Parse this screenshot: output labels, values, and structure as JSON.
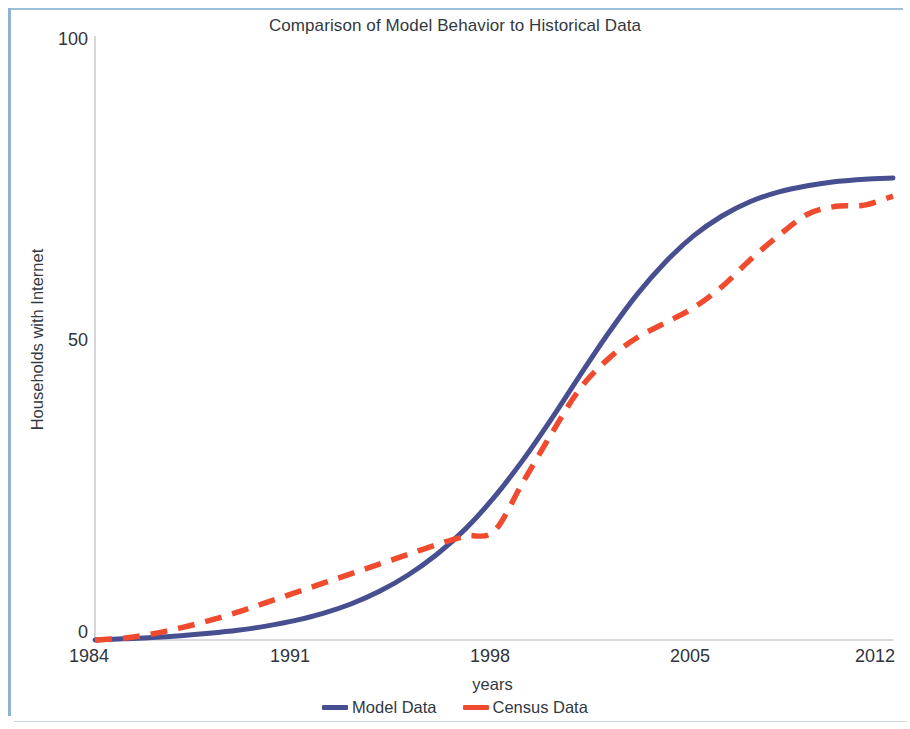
{
  "chart_data": {
    "type": "line",
    "title": "Comparison of Model Behavior to Historical Data",
    "xlabel": "years",
    "ylabel": "Households with Internet",
    "xlim": [
      1984,
      2012
    ],
    "ylim": [
      0,
      100
    ],
    "xticks": [
      1984,
      1991,
      1998,
      2005,
      2012
    ],
    "yticks": [
      0,
      50,
      100
    ],
    "grid": false,
    "legend_position": "bottom-center",
    "series": [
      {
        "name": "Model Data",
        "color": "#474f91",
        "style": "solid",
        "x": [
          1984,
          1985,
          1986,
          1987,
          1988,
          1989,
          1990,
          1991,
          1992,
          1993,
          1994,
          1995,
          1996,
          1997,
          1998,
          1999,
          2000,
          2001,
          2002,
          2003,
          2004,
          2005,
          2006,
          2007,
          2008,
          2009,
          2010,
          2011,
          2012
        ],
        "values": [
          0,
          0.2,
          0.4,
          0.7,
          1.1,
          1.6,
          2.3,
          3.2,
          4.4,
          6.0,
          8.1,
          10.8,
          14.2,
          18.4,
          23.6,
          29.7,
          36.5,
          43.7,
          50.7,
          57.1,
          62.5,
          66.9,
          70.2,
          72.6,
          74.2,
          75.2,
          75.9,
          76.3,
          76.5
        ]
      },
      {
        "name": "Census Data",
        "color": "#f04b2e",
        "style": "dashed",
        "x": [
          1984,
          1985,
          1986,
          1987,
          1988,
          1989,
          1990,
          1991,
          1992,
          1993,
          1994,
          1995,
          1996,
          1997,
          1998,
          1999,
          2000,
          2001,
          2002,
          2003,
          2004,
          2005,
          2006,
          2007,
          2008,
          2009,
          2010,
          2011,
          2012
        ],
        "values": [
          0,
          0.3,
          1.0,
          2.0,
          3.2,
          4.6,
          6.2,
          7.8,
          9.4,
          11.0,
          12.6,
          14.2,
          15.8,
          17.2,
          18.0,
          26.0,
          34.0,
          41.5,
          46.5,
          50.0,
          52.5,
          55.0,
          58.5,
          63.0,
          67.0,
          70.5,
          71.8,
          72.0,
          73.5
        ]
      }
    ]
  },
  "legend": {
    "items": [
      {
        "label": "Model Data",
        "color": "#474f91"
      },
      {
        "label": "Census Data",
        "color": "#f04b2e"
      }
    ]
  },
  "axis": {
    "y_tick_labels": [
      "100",
      "50",
      "0"
    ],
    "x_tick_labels": [
      "1984",
      "1991",
      "1998",
      "2005",
      "2012"
    ]
  }
}
